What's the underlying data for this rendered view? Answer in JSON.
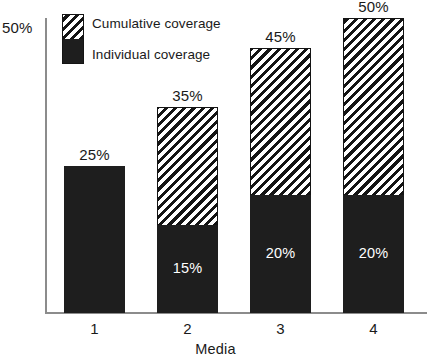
{
  "chart_data": {
    "type": "bar",
    "subtype": "stacked-bar",
    "title": "",
    "xlabel": "Media",
    "ylabel": "",
    "categories": [
      "1",
      "2",
      "3",
      "4"
    ],
    "ylim": [
      0,
      50
    ],
    "grid": false,
    "y_tick_labels": [
      "50%"
    ],
    "y_ticks": [
      50
    ],
    "legend_position": "top-left-inside",
    "series": [
      {
        "name": "Individual coverage",
        "fill": "solid-black",
        "values": [
          25,
          15,
          20,
          20
        ],
        "value_labels": [
          "25%",
          "15%",
          "20%",
          "20%"
        ],
        "label_position": "inside-white"
      },
      {
        "name": "Cumulative coverage",
        "fill": "diagonal-hatch",
        "values": [
          0,
          20,
          25,
          30
        ],
        "cumulative_totals": [
          25,
          35,
          45,
          50
        ],
        "total_labels": [
          "25%",
          "35%",
          "45%",
          "50%"
        ],
        "label_position": "above-bar"
      }
    ],
    "colors": {
      "ink": "#141414",
      "solid_fill": "#1e1e1e",
      "hatch_stripe": "#141414",
      "hatch_background": "#ffffff",
      "axis": "#8c8c8c",
      "text": "#1a1a1a",
      "inner_label_text": "#ffffff",
      "background": "#ffffff"
    }
  },
  "axes": {
    "y_top_label": "50%",
    "x_title": "Media",
    "x_labels": [
      "1",
      "2",
      "3",
      "4"
    ]
  },
  "legend": {
    "items": [
      {
        "label": "Cumulative coverage",
        "fill": "diagonal-hatch"
      },
      {
        "label": "Individual coverage",
        "fill": "solid-black"
      }
    ]
  },
  "bars": [
    {
      "category": "1",
      "total_label": "25%",
      "individual_label": "25%",
      "show_individual_label": false,
      "total_pct": 25,
      "individual_pct": 25
    },
    {
      "category": "2",
      "total_label": "35%",
      "individual_label": "15%",
      "show_individual_label": true,
      "total_pct": 35,
      "individual_pct": 15
    },
    {
      "category": "3",
      "total_label": "45%",
      "individual_label": "20%",
      "show_individual_label": true,
      "total_pct": 45,
      "individual_pct": 20
    },
    {
      "category": "4",
      "total_label": "50%",
      "individual_label": "20%",
      "show_individual_label": true,
      "total_pct": 50,
      "individual_pct": 20
    }
  ]
}
